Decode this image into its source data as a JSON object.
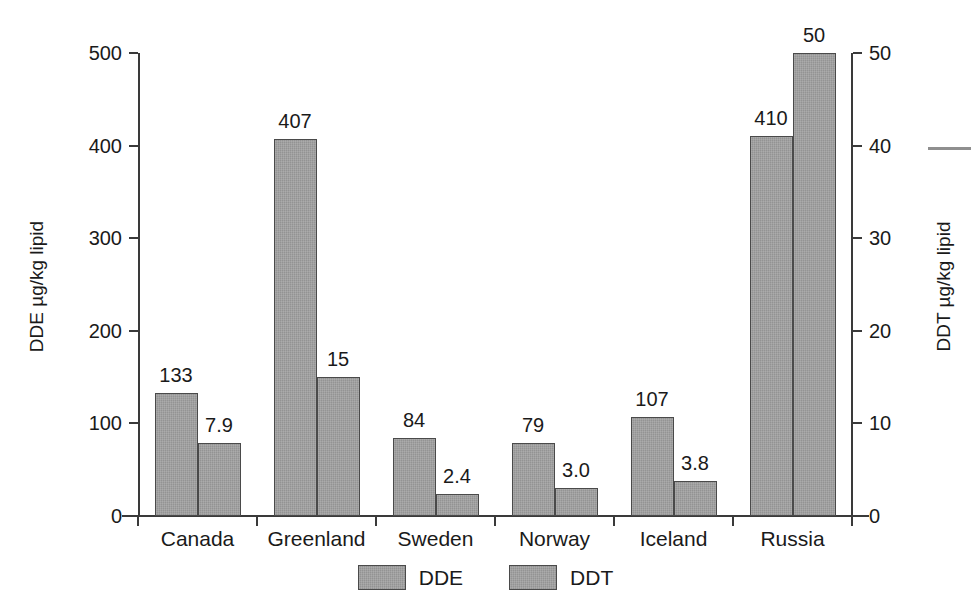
{
  "chart_data": {
    "type": "bar",
    "title": "",
    "subtitle": "",
    "xlabel": "",
    "ylabel": "DDE µg/kg lipid",
    "y2label": "DDT µg/kg lipid",
    "categories": [
      "Canada",
      "Greenland",
      "Sweden",
      "Norway",
      "Iceland",
      "Russia"
    ],
    "series": [
      {
        "name": "DDE",
        "axis": "left",
        "unit": "µg/kg lipid",
        "values": [
          133,
          407,
          84,
          79,
          107,
          410
        ],
        "labels": [
          "133",
          "407",
          "84",
          "79",
          "107",
          "410"
        ]
      },
      {
        "name": "DDT",
        "axis": "right",
        "unit": "µg/kg lipid",
        "values": [
          7.9,
          15,
          2.4,
          3.0,
          3.8,
          50
        ],
        "labels": [
          "7.9",
          "15",
          "2.4",
          "3.0",
          "3.8",
          "50"
        ]
      }
    ],
    "ylim": [
      0,
      500
    ],
    "yticks": [
      0,
      100,
      200,
      300,
      400,
      500
    ],
    "yticklabels": [
      "0",
      "100",
      "200",
      "300",
      "400",
      "500"
    ],
    "y2lim": [
      0,
      50
    ],
    "y2ticks": [
      0,
      10,
      20,
      30,
      40,
      50
    ],
    "y2ticklabels": [
      "0",
      "10",
      "20",
      "30",
      "40",
      "50"
    ],
    "grid": false,
    "legend": {
      "position": "bottom-center",
      "entries": [
        "DDE",
        "DDT"
      ]
    },
    "colors": {
      "bar_fill": "#9b9b9b",
      "bar_edge": "#4a4a4a",
      "axis": "#3a3a3a",
      "text": "#1a1a1a",
      "background": "#ffffff"
    }
  }
}
